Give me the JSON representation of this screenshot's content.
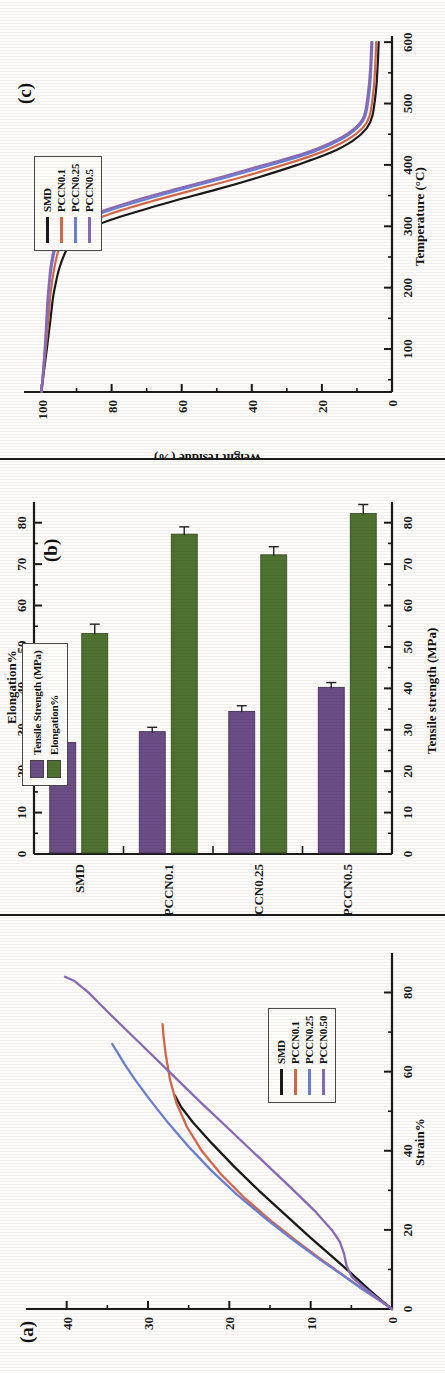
{
  "figure": {
    "panels": [
      "c",
      "b",
      "a"
    ],
    "colors": {
      "smd": "#1a1a1a",
      "pccn01": "#d4694a",
      "pccn025": "#6b7fd4",
      "pccn05": "#8a6bb5",
      "tensile_bar": "#6b4e85",
      "elongation_bar": "#4f7230",
      "axis": "#1a1a1a"
    }
  },
  "chart_data": [
    {
      "id": "panel-a",
      "tag": "(a)",
      "type": "line",
      "title": "",
      "xlabel": "Strain%",
      "ylabel": "Stress (MPa)",
      "xlim": [
        0,
        90
      ],
      "ylim": [
        0,
        45
      ],
      "xticks": [
        0,
        20,
        40,
        60,
        80
      ],
      "yticks": [
        0,
        10,
        20,
        30,
        40
      ],
      "grid": false,
      "legend_position": "lower-right",
      "series": [
        {
          "name": "SMD",
          "color": "#1a1a1a",
          "x": [
            0,
            2,
            5,
            9,
            13,
            18,
            24,
            30,
            36,
            42,
            47,
            51,
            54
          ],
          "y": [
            0,
            1.2,
            2.9,
            5.0,
            7.2,
            10.0,
            13.2,
            16.4,
            19.4,
            22.2,
            24.4,
            25.9,
            26.7
          ]
        },
        {
          "name": "PCCN0.1",
          "color": "#d4694a",
          "x": [
            0,
            2,
            5,
            9,
            13,
            17,
            22,
            28,
            34,
            40,
            46,
            52,
            58,
            64,
            69,
            72
          ],
          "y": [
            0,
            1.4,
            3.6,
            6.3,
            9.0,
            11.6,
            14.7,
            18.1,
            21.0,
            23.4,
            25.2,
            26.5,
            27.3,
            27.8,
            28.1,
            28.2
          ]
        },
        {
          "name": "PCCN0.25",
          "color": "#6b7fd4",
          "x": [
            0,
            2,
            5,
            9,
            13,
            18,
            23,
            29,
            35,
            41,
            47,
            53,
            58,
            62,
            65,
            67
          ],
          "y": [
            0,
            1.4,
            3.6,
            6.4,
            9.2,
            12.5,
            15.6,
            19.1,
            22.2,
            25.0,
            27.5,
            29.8,
            31.6,
            32.9,
            33.8,
            34.4
          ]
        },
        {
          "name": "PCCN0.50",
          "color": "#8a6bb5",
          "x": [
            0,
            2,
            5,
            8,
            11,
            14,
            17,
            20,
            25,
            31,
            38,
            45,
            52,
            60,
            68,
            75,
            80,
            83,
            84
          ],
          "y": [
            0,
            1.3,
            3.2,
            4.9,
            5.6,
            5.9,
            6.4,
            7.4,
            9.6,
            12.6,
            16.2,
            19.8,
            23.4,
            27.4,
            31.4,
            34.9,
            37.3,
            39.1,
            40.2
          ]
        }
      ]
    },
    {
      "id": "panel-b",
      "tag": "(b)",
      "type": "bar",
      "orientation": "horizontal",
      "categories": [
        "SMD",
        "PCCN0.1",
        "PCCN0.25",
        "PCCN0.5"
      ],
      "xlabel": "",
      "ylabel_bottom": "Tensile strength (MPa)",
      "ylabel_top": "Elongation%",
      "axis_bottom_ticks": [
        0,
        10,
        20,
        30,
        40,
        50,
        60,
        70,
        80
      ],
      "axis_top_ticks": [
        0,
        10,
        20,
        30,
        40,
        50,
        60,
        70,
        80
      ],
      "lim": [
        0,
        85
      ],
      "grid": false,
      "legend_position": "upper-left",
      "series": [
        {
          "name": "Tensile Strength (MPa)",
          "color": "#6b4e85",
          "values": [
            26.7,
            29.3,
            34.2,
            40.0
          ],
          "errors": [
            1.5,
            1.3,
            1.6,
            1.4
          ]
        },
        {
          "name": "Elongation%",
          "color": "#4f7230",
          "values": [
            53.0,
            77.0,
            72.0,
            82.0
          ],
          "errors": [
            2.5,
            2.0,
            2.2,
            2.4
          ]
        }
      ]
    },
    {
      "id": "panel-c",
      "tag": "(c)",
      "type": "line",
      "xlabel": "Temperature (°C)",
      "ylabel": "Weight residue (%)",
      "xlim": [
        30,
        610
      ],
      "ylim": [
        0,
        105
      ],
      "xticks": [
        100,
        200,
        300,
        400,
        500,
        600
      ],
      "yticks": [
        0,
        20,
        40,
        60,
        80,
        100
      ],
      "grid": false,
      "legend_position": "upper-left",
      "series": [
        {
          "name": "SMD",
          "color": "#1a1a1a",
          "x": [
            30,
            60,
            100,
            150,
            180,
            200,
            230,
            260,
            280,
            300,
            320,
            340,
            360,
            380,
            400,
            420,
            440,
            460,
            480,
            520,
            560,
            600
          ],
          "y": [
            100,
            99.4,
            98.5,
            97.4,
            96.8,
            96.2,
            95.0,
            93.0,
            90.4,
            85.0,
            75.0,
            63.0,
            50.0,
            38.0,
            27.0,
            17.5,
            11.0,
            7.2,
            5.6,
            4.6,
            4.1,
            3.8
          ]
        },
        {
          "name": "PCCN0.1",
          "color": "#d4694a",
          "x": [
            30,
            60,
            100,
            150,
            180,
            200,
            230,
            260,
            280,
            300,
            320,
            340,
            360,
            380,
            400,
            420,
            440,
            460,
            480,
            520,
            560,
            600
          ],
          "y": [
            100,
            99.5,
            98.8,
            98.0,
            97.6,
            97.2,
            96.4,
            95.2,
            93.4,
            89.0,
            80.5,
            69.0,
            56.0,
            43.0,
            31.0,
            20.5,
            13.0,
            8.4,
            6.4,
            5.3,
            4.8,
            4.5
          ]
        },
        {
          "name": "PCCN0.25",
          "color": "#6b7fd4",
          "x": [
            30,
            60,
            100,
            150,
            180,
            200,
            230,
            260,
            280,
            300,
            320,
            340,
            360,
            380,
            400,
            420,
            440,
            460,
            480,
            520,
            560,
            600
          ],
          "y": [
            100,
            99.6,
            99.0,
            98.4,
            98.1,
            97.8,
            97.2,
            96.2,
            94.8,
            91.0,
            83.5,
            72.5,
            60.0,
            47.0,
            34.5,
            23.0,
            15.0,
            10.0,
            7.6,
            6.4,
            5.9,
            5.6
          ]
        },
        {
          "name": "PCCN0.5",
          "color": "#8a6bb5",
          "x": [
            30,
            60,
            100,
            150,
            180,
            200,
            230,
            260,
            280,
            300,
            320,
            340,
            360,
            380,
            400,
            420,
            440,
            460,
            480,
            520,
            560,
            600
          ],
          "y": [
            100,
            99.6,
            99.1,
            98.6,
            98.3,
            98.0,
            97.5,
            96.6,
            95.3,
            92.0,
            85.0,
            74.5,
            62.0,
            49.0,
            36.5,
            24.5,
            16.0,
            10.6,
            8.0,
            6.8,
            6.2,
            5.9
          ]
        }
      ]
    }
  ],
  "panel_a": {
    "tag": "(a)",
    "xlabel": "Strain%",
    "ylabel": "Stress (MPa)",
    "xticks": [
      "0",
      "20",
      "40",
      "60",
      "80"
    ],
    "yticks": [
      "0",
      "10",
      "20",
      "30",
      "40"
    ],
    "legend": [
      "SMD",
      "PCCN0.1",
      "PCCN0.25",
      "PCCN0.50"
    ]
  },
  "panel_b": {
    "tag": "(b)",
    "axis_bottom_label": "Tensile strength (MPa)",
    "axis_top_label": "Elongation%",
    "ticks": [
      "0",
      "10",
      "20",
      "30",
      "40",
      "50",
      "60",
      "70",
      "80"
    ],
    "categories": [
      "SMD",
      "PCCN0.1",
      "PCCN0.25",
      "PCCN0.5"
    ],
    "legend": [
      "Tensile Strength (MPa)",
      "Elongation%"
    ]
  },
  "panel_c": {
    "tag": "(c)",
    "xlabel": "Temperature (°C)",
    "ylabel": "Weight residue (%)",
    "xticks": [
      "100",
      "200",
      "300",
      "400",
      "500",
      "600"
    ],
    "yticks": [
      "0",
      "20",
      "40",
      "60",
      "80",
      "100"
    ],
    "legend": [
      "SMD",
      "PCCN0.1",
      "PCCN0.25",
      "PCCN0.5"
    ]
  }
}
